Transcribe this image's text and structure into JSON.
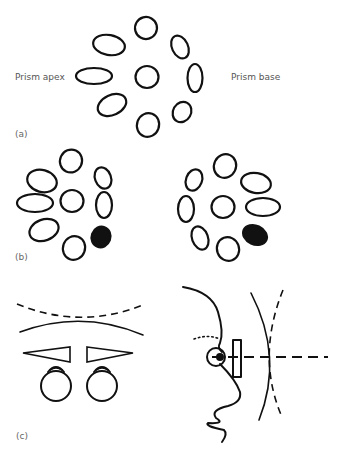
{
  "figure": {
    "panel_a": {
      "label": "(a)",
      "left_text": "Prism apex",
      "right_text": "Prism base",
      "description": "Ring of 8 ellipses around a central circle; ellipses elongated toward the prism apex side"
    },
    "panel_b": {
      "label": "(b)",
      "description": "Two rings of ellipses, each with one filled (black) ellipse at lower right, showing rotation of the pattern"
    },
    "panel_c": {
      "label": "(c)",
      "description_left": "Front view: dashed curve and solid arc above two base-in/base-out prisms before two eyes",
      "description_right": "Side view: face profile, eye with pupil, prism block, dashed line of sight crossing a solid and a dashed arc"
    },
    "colors": {
      "stroke": "#111111",
      "label_text": "#555555",
      "background": "#ffffff"
    }
  }
}
